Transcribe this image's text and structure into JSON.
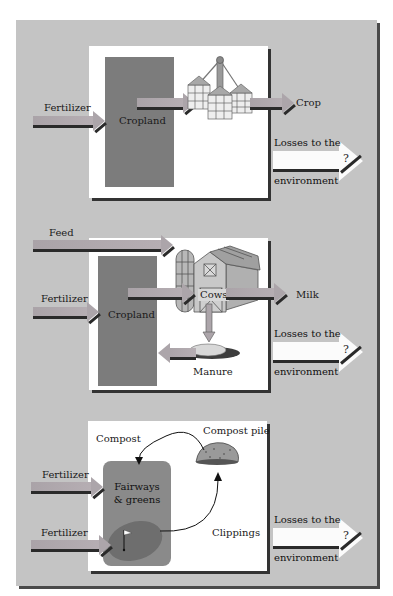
{
  "colors": {
    "background": "#c4c4c4",
    "panel": "#ffffff",
    "cropland": "#7c7c7c",
    "fairways": "#8a8a8a",
    "green": "#6e6e6e",
    "arrow": "#aca5aa",
    "shadow": "#2a2a2a"
  },
  "panels": [
    {
      "name": "cropland-system",
      "inputs": [
        {
          "label": "Fertilizer"
        }
      ],
      "process": "Cropland",
      "storage_icon": "grain-silos-icon",
      "output": "Crop",
      "losses": {
        "line1": "Losses to the",
        "line2": "environment",
        "mark": "?"
      }
    },
    {
      "name": "dairy-system",
      "inputs": [
        {
          "label": "Feed"
        },
        {
          "label": "Fertilizer"
        }
      ],
      "process": "Cropland",
      "animal": "Cows",
      "output": "Milk",
      "byproduct": "Manure",
      "losses": {
        "line1": "Losses to the",
        "line2": "environment",
        "mark": "?"
      }
    },
    {
      "name": "golf-course-system",
      "inputs": [
        {
          "label": "Fertilizer"
        },
        {
          "label": "Fertilizer"
        }
      ],
      "process": "Fairways & greens",
      "compost_label": "Compost",
      "compost_pile_label": "Compost pile",
      "clippings_label": "Clippings",
      "losses": {
        "line1": "Losses to the",
        "line2": "environment",
        "mark": "?"
      }
    }
  ]
}
